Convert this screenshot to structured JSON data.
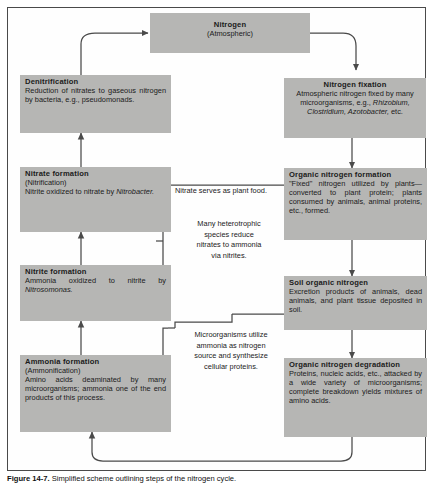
{
  "figure": {
    "caption_label": "Figure 14-7.",
    "caption_text": "Simplified scheme outlining steps of the nitrogen cycle.",
    "background_color": "#ffffff",
    "box_fill_color": "#b6b6b4",
    "line_color": "#4a4a4a",
    "text_color": "#1b1b1b"
  },
  "boxes": {
    "nitrogen_atmospheric": {
      "title": "Nitrogen",
      "subtitle": "(Atmospheric)"
    },
    "denitrification": {
      "title": "Denitrification",
      "body": "Reduction of nitrates to gaseous nitrogen by bacteria, e.g., pseudomonads."
    },
    "nitrogen_fixation": {
      "title": "Nitrogen fixation",
      "body_part1": "Atmospheric nitrogen fixed by many microorganisms, e.g., ",
      "body_italic1": "Rhizobium, Clostridium, Azotobacter,",
      "body_part2": " etc."
    },
    "nitrate_formation": {
      "title": "Nitrate formation",
      "subtitle": "(Nitrification)",
      "body_part1": "Nitrite oxidized to nitrate by ",
      "body_italic1": "Nitrobacter.",
      "body_part2": ""
    },
    "nitrite_formation": {
      "title": "Nitrite formation",
      "body_part1": "Ammonia oxidized to nitrite by ",
      "body_italic1": "Nitrosomonas.",
      "body_part2": ""
    },
    "ammonia_formation": {
      "title": "Ammonia formation",
      "subtitle": "(Ammonification)",
      "body": "Amino acids deaminated by many microorganisms; ammonia one of the end products of this process."
    },
    "organic_nitrogen_formation": {
      "title": "Organic nitrogen formation",
      "body": "\"Fixed\" nitrogen utilized by plants—converted to plant protein; plants consumed by animals, animal proteins, etc., formed."
    },
    "soil_organic_nitrogen": {
      "title": "Soil organic nitrogen",
      "body": "Excretion products of animals, dead animals, and plant tissue deposited in soil."
    },
    "organic_nitrogen_degradation": {
      "title": "Organic nitrogen degradation",
      "body": "Proteins, nucleic acids, etc., attacked by a wide variety of microorganisms; complete breakdown yields mixtures of amino acids."
    }
  },
  "annotations": {
    "nitrate_plant_food": "Nitrate serves as plant food.",
    "heterotrophic_reduction": "Many heterotrophic\nspecies reduce\nnitrates to ammonia\nvia nitrites.",
    "microorganisms_utilize": "Microorganisms utilize\nammonia as nitrogen\nsource and synthesize\ncellular proteins."
  }
}
